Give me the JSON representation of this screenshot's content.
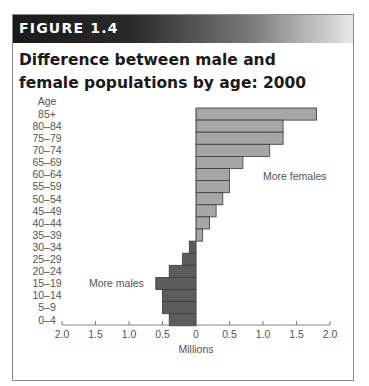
{
  "figure": {
    "label": "FIGURE 1.4",
    "title": "Difference between male and female populations by age: 2000"
  },
  "chart_data": {
    "type": "bar",
    "orientation": "horizontal",
    "title": "Difference between male and female populations by age: 2000",
    "xlabel": "Millions",
    "ylabel": "Age",
    "xlim": [
      -2.0,
      2.0
    ],
    "x_tick_labels": [
      "2.0",
      "1.5",
      "1.0",
      "0.5",
      "0",
      "0.5",
      "1.0",
      "1.5",
      "2.0"
    ],
    "x_tick_values": [
      -2.0,
      -1.5,
      -1.0,
      -0.5,
      0,
      0.5,
      1.0,
      1.5,
      2.0
    ],
    "categories": [
      "85+",
      "80–84",
      "75–79",
      "70–74",
      "65–69",
      "60–64",
      "55–59",
      "50–54",
      "45–49",
      "40–44",
      "35–39",
      "30–34",
      "25–29",
      "20–24",
      "15–19",
      "10–14",
      "5–9",
      "0–4"
    ],
    "values": [
      1.8,
      1.3,
      1.3,
      1.1,
      0.7,
      0.5,
      0.5,
      0.4,
      0.3,
      0.2,
      0.1,
      -0.1,
      -0.2,
      -0.4,
      -0.6,
      -0.5,
      -0.5,
      -0.4
    ],
    "annotations": [
      {
        "text": "More females",
        "side": "positive"
      },
      {
        "text": "More males",
        "side": "negative"
      }
    ],
    "colors": {
      "females": "#a6a6a6",
      "males": "#5c5c5c",
      "bar_edge": "#3a3a3a"
    },
    "grid": false,
    "legend": "none"
  }
}
